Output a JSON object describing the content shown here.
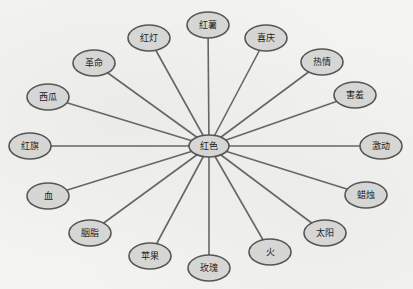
{
  "diagram": {
    "type": "radial-mind-map",
    "center": {
      "label": "红色"
    },
    "nodes": [
      {
        "label": "红薯"
      },
      {
        "label": "喜庆"
      },
      {
        "label": "热情"
      },
      {
        "label": "害羞"
      },
      {
        "label": "激动"
      },
      {
        "label": "蜡烛"
      },
      {
        "label": "太阳"
      },
      {
        "label": "火"
      },
      {
        "label": "玫瑰"
      },
      {
        "label": "苹果"
      },
      {
        "label": "胭脂"
      },
      {
        "label": "血"
      },
      {
        "label": "红旗"
      },
      {
        "label": "西瓜"
      },
      {
        "label": "革命"
      },
      {
        "label": "红灯"
      }
    ]
  }
}
